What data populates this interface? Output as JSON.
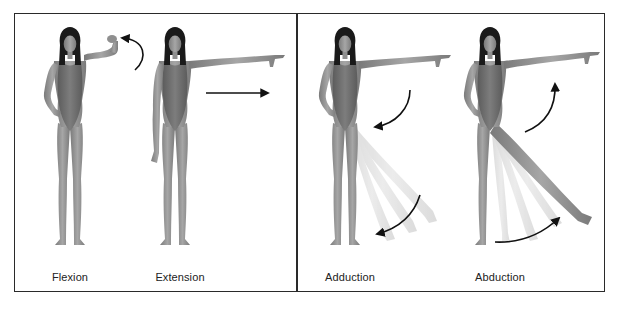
{
  "figure": {
    "panels": [
      {
        "id": "left",
        "figures": [
          {
            "label": "Flexion",
            "movement": "arm-flexion",
            "arrow": "curved-arrow-up-left"
          },
          {
            "label": "Extension",
            "movement": "arm-extension",
            "arrow": "straight-arrow-right"
          }
        ]
      },
      {
        "id": "right",
        "figures": [
          {
            "label": "Adduction",
            "movement": "arm-leg-adduction",
            "arrow": "curved-arrow-down-left"
          },
          {
            "label": "Abduction",
            "movement": "arm-leg-abduction",
            "arrow": "curved-arrow-up-right"
          }
        ]
      }
    ],
    "colors": {
      "border": "#2a2a2a",
      "skin": "#8c8c8c",
      "skin_light": "#a8a8a8",
      "swimsuit": "#6e6e6e",
      "hair": "#1a1a1a",
      "arrow": "#111111",
      "ghost_limb": "#d4d4d4",
      "label_text": "#222222"
    }
  }
}
